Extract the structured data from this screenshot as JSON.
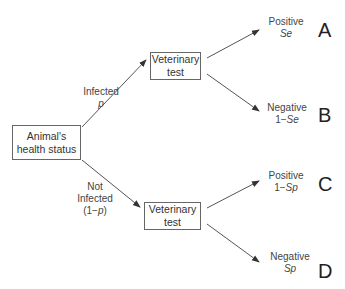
{
  "root": {
    "line1": "Animal's",
    "line2": "health status"
  },
  "branches": {
    "infected": {
      "line1": "Infected",
      "line2": "p"
    },
    "not_infected": {
      "line1": "Not",
      "line2": "Infected",
      "line3_pre": "(1−",
      "line3_var": "p",
      "line3_post": ")"
    }
  },
  "tests": {
    "top": {
      "line1": "Veterinary",
      "line2": "test"
    },
    "bottom": {
      "line1": "Veterinary",
      "line2": "test"
    }
  },
  "outcomes": [
    {
      "label": "Positive",
      "prob_pre": "",
      "prob_var": "Se",
      "letter": "A"
    },
    {
      "label": "Negative",
      "prob_pre": "1−",
      "prob_var": "Se",
      "letter": "B"
    },
    {
      "label": "Positive",
      "prob_pre": "1−",
      "prob_var": "Sp",
      "letter": "C"
    },
    {
      "label": "Negative",
      "prob_pre": "",
      "prob_var": "Sp",
      "letter": "D"
    }
  ]
}
